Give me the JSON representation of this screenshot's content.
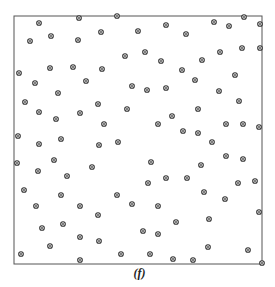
{
  "figure": {
    "caption": "(f)",
    "frame": {
      "x0": 14,
      "y0": 16,
      "x1": 262,
      "y1": 264
    },
    "colors": {
      "frame": "#555555",
      "marker_edge": "#333333",
      "marker_fill": "#555555"
    }
  },
  "chart_data": {
    "type": "scatter",
    "title": "",
    "caption": "(f)",
    "xlabel": "",
    "ylabel": "",
    "grid": false,
    "legend": null,
    "axes_visible": false,
    "note": "Point coordinates are in pixel space of the 275x287 image; the plot region is the square frame from (14,16) to (262,264).",
    "xlim": [
      14,
      262
    ],
    "ylim": [
      16,
      264
    ],
    "points": [
      [
        39,
        23
      ],
      [
        79,
        18
      ],
      [
        30,
        41
      ],
      [
        51,
        36
      ],
      [
        78,
        40
      ],
      [
        19,
        73
      ],
      [
        50,
        68
      ],
      [
        73,
        67
      ],
      [
        35,
        83
      ],
      [
        86,
        81
      ],
      [
        58,
        93
      ],
      [
        117,
        16
      ],
      [
        101,
        32
      ],
      [
        138,
        31
      ],
      [
        166,
        25
      ],
      [
        125,
        56
      ],
      [
        145,
        52
      ],
      [
        161,
        61
      ],
      [
        102,
        69
      ],
      [
        182,
        70
      ],
      [
        132,
        86
      ],
      [
        147,
        90
      ],
      [
        166,
        88
      ],
      [
        214,
        22
      ],
      [
        229,
        26
      ],
      [
        244,
        17
      ],
      [
        260,
        24
      ],
      [
        186,
        34
      ],
      [
        220,
        52
      ],
      [
        242,
        48
      ],
      [
        260,
        48
      ],
      [
        202,
        60
      ],
      [
        195,
        80
      ],
      [
        235,
        75
      ],
      [
        219,
        91
      ],
      [
        25,
        102
      ],
      [
        39,
        112
      ],
      [
        56,
        119
      ],
      [
        80,
        113
      ],
      [
        98,
        104
      ],
      [
        18,
        136
      ],
      [
        39,
        144
      ],
      [
        61,
        139
      ],
      [
        99,
        145
      ],
      [
        17,
        163
      ],
      [
        54,
        160
      ],
      [
        38,
        171
      ],
      [
        92,
        167
      ],
      [
        67,
        176
      ],
      [
        127,
        109
      ],
      [
        104,
        124
      ],
      [
        158,
        124
      ],
      [
        172,
        116
      ],
      [
        183,
        131
      ],
      [
        118,
        142
      ],
      [
        151,
        162
      ],
      [
        166,
        178
      ],
      [
        148,
        183
      ],
      [
        239,
        101
      ],
      [
        198,
        109
      ],
      [
        226,
        124
      ],
      [
        243,
        124
      ],
      [
        259,
        127
      ],
      [
        198,
        133
      ],
      [
        212,
        142
      ],
      [
        226,
        156
      ],
      [
        243,
        159
      ],
      [
        201,
        165
      ],
      [
        187,
        178
      ],
      [
        238,
        183
      ],
      [
        255,
        181
      ],
      [
        24,
        190
      ],
      [
        61,
        195
      ],
      [
        36,
        206
      ],
      [
        80,
        206
      ],
      [
        98,
        215
      ],
      [
        42,
        228
      ],
      [
        63,
        224
      ],
      [
        50,
        246
      ],
      [
        80,
        237
      ],
      [
        21,
        254
      ],
      [
        80,
        260
      ],
      [
        117,
        195
      ],
      [
        132,
        204
      ],
      [
        158,
        206
      ],
      [
        176,
        222
      ],
      [
        143,
        231
      ],
      [
        158,
        234
      ],
      [
        99,
        241
      ],
      [
        121,
        254
      ],
      [
        150,
        254
      ],
      [
        173,
        259
      ],
      [
        204,
        192
      ],
      [
        225,
        199
      ],
      [
        259,
        212
      ],
      [
        209,
        219
      ],
      [
        208,
        247
      ],
      [
        248,
        250
      ],
      [
        193,
        260
      ],
      [
        262,
        263
      ]
    ]
  }
}
